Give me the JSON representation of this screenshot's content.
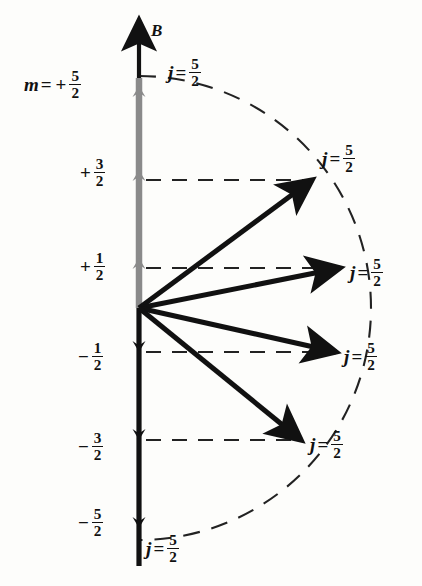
{
  "figure": {
    "axis_label": "B",
    "m_label_prefix": "m",
    "equals": "=",
    "plus": "+",
    "minus": "−",
    "j_symbol": "j",
    "j_value_num": "5",
    "j_value_den": "2"
  },
  "colors": {
    "ink": "#111111",
    "vector_up_gray": "#8a8a8a",
    "vector_down_black": "#111111",
    "dashed": "#222222",
    "background": "#fdfdfb"
  },
  "m_levels": [
    {
      "id": "m-plus-5-2",
      "sign": "+",
      "num": "5",
      "den": "2",
      "value": 2.5,
      "label_x": 24,
      "label_y": 68,
      "line_y": 78,
      "has_dashed_line": false,
      "has_vector": true,
      "vector_kind": "axis-up"
    },
    {
      "id": "m-plus-3-2",
      "sign": "+",
      "num": "3",
      "den": "2",
      "value": 1.5,
      "label_x": 78,
      "label_y": 156,
      "line_y": 180,
      "has_dashed_line": true,
      "has_vector": true,
      "vector_kind": "tilted"
    },
    {
      "id": "m-plus-1-2",
      "sign": "+",
      "num": "1",
      "den": "2",
      "value": 0.5,
      "label_x": 78,
      "label_y": 250,
      "line_y": 268,
      "has_dashed_line": true,
      "has_vector": true,
      "vector_kind": "tilted"
    },
    {
      "id": "m-minus-1-2",
      "sign": "−",
      "num": "1",
      "den": "2",
      "value": -0.5,
      "label_x": 76,
      "label_y": 340,
      "line_y": 352,
      "has_dashed_line": true,
      "has_vector": true,
      "vector_kind": "tilted"
    },
    {
      "id": "m-minus-3-2",
      "sign": "−",
      "num": "3",
      "den": "2",
      "value": -1.5,
      "label_x": 76,
      "label_y": 430,
      "line_y": 440,
      "has_dashed_line": true,
      "has_vector": true,
      "vector_kind": "tilted"
    },
    {
      "id": "m-minus-5-2",
      "sign": "−",
      "num": "5",
      "den": "2",
      "value": -2.5,
      "label_x": 76,
      "label_y": 506,
      "line_y": 532,
      "has_dashed_line": false,
      "has_vector": true,
      "vector_kind": "axis-down"
    }
  ],
  "m_equals_label": {
    "x": 24,
    "y": 68,
    "text_prefix": "m",
    "equals": "=",
    "sign": "+",
    "num": "5",
    "den": "2"
  },
  "j_labels": [
    {
      "id": "j-top",
      "x": 168,
      "y": 56,
      "num": "5",
      "den": "2"
    },
    {
      "id": "j-plus-3-2",
      "x": 322,
      "y": 142,
      "num": "5",
      "den": "2"
    },
    {
      "id": "j-plus-1-2",
      "x": 350,
      "y": 256,
      "num": "5",
      "den": "2"
    },
    {
      "id": "j-minus-1-2",
      "x": 344,
      "y": 340,
      "num": "5",
      "den": "2"
    },
    {
      "id": "j-minus-3-2",
      "x": 310,
      "y": 428,
      "num": "5",
      "den": "2"
    },
    {
      "id": "j-bottom",
      "x": 146,
      "y": 532,
      "num": "5",
      "den": "2"
    }
  ],
  "b_axis_label": {
    "x": 151,
    "y": 22,
    "text": "B"
  },
  "geometry": {
    "origin_x": 139,
    "origin_y": 308,
    "axis_top_y": 20,
    "axis_bottom_y": 566,
    "arc_radius": 232,
    "arc_start_deg": 90,
    "arc_end_deg": -90,
    "vectors": [
      {
        "id": "vec-plus-3-2",
        "tip_x": 312,
        "tip_y": 180
      },
      {
        "id": "vec-plus-1-2",
        "tip_x": 340,
        "tip_y": 268
      },
      {
        "id": "vec-minus-1-2",
        "tip_x": 336,
        "tip_y": 352
      },
      {
        "id": "vec-minus-3-2",
        "tip_x": 301,
        "tip_y": 440
      }
    ],
    "dashed_lines": [
      {
        "id": "dash-plus-3-2",
        "y": 180,
        "x1": 146,
        "x2": 308
      },
      {
        "id": "dash-plus-1-2",
        "y": 268,
        "x1": 146,
        "x2": 336
      },
      {
        "id": "dash-minus-1-2",
        "y": 352,
        "x1": 146,
        "x2": 332
      },
      {
        "id": "dash-minus-3-2",
        "y": 440,
        "x1": 146,
        "x2": 297
      }
    ]
  }
}
